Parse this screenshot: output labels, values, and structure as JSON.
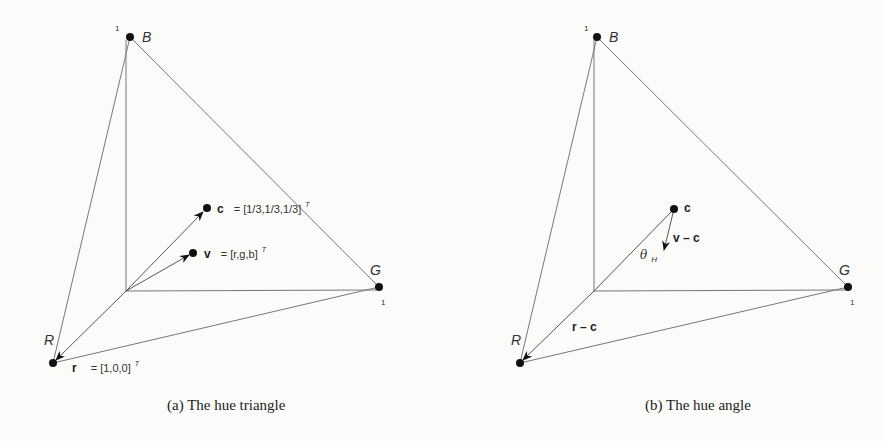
{
  "panel_a": {
    "caption": "(a)  The hue triangle",
    "vertices": {
      "B": {
        "label": "B",
        "tick": "1"
      },
      "G": {
        "label": "G",
        "tick": "1"
      },
      "R": {
        "label": "R"
      }
    },
    "vectors": {
      "c": {
        "symbol": "c",
        "equation": "= [1/3,1/3,1/3]",
        "superscript": "T"
      },
      "v": {
        "symbol": "v",
        "equation": "= [r,g,b]",
        "superscript": "T"
      },
      "r": {
        "symbol": "r",
        "equation": "= [1,0,0]",
        "superscript": "T"
      }
    }
  },
  "panel_b": {
    "caption": "(b)  The hue angle",
    "vertices": {
      "B": {
        "label": "B",
        "tick": "1"
      },
      "G": {
        "label": "G",
        "tick": "1"
      },
      "R": {
        "label": "R"
      }
    },
    "labels": {
      "c": "c",
      "v_minus_c": "v – c",
      "r_minus_c": "r – c",
      "theta": "θ",
      "theta_sub": "H"
    }
  }
}
